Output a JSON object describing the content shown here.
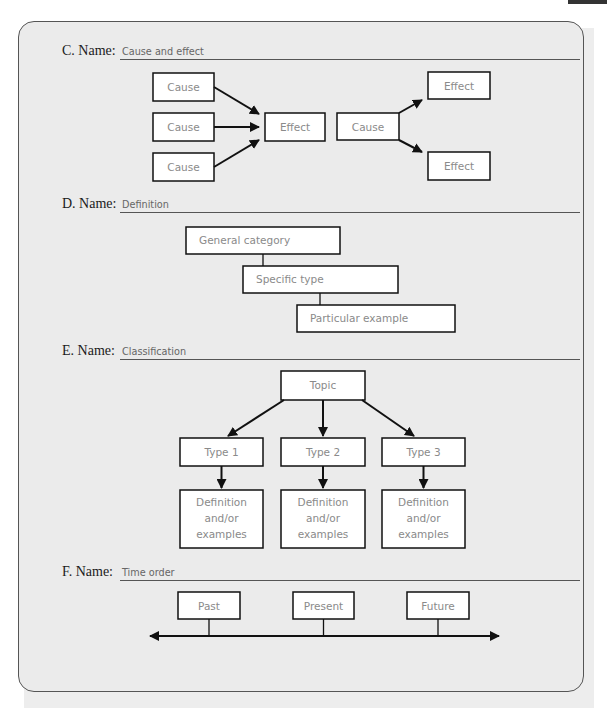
{
  "sections": {
    "c": {
      "label": "C. Name:",
      "value": "Cause and effect",
      "left_causes": [
        "Cause",
        "Cause",
        "Cause"
      ],
      "center_effect": "Effect",
      "right_cause": "Cause",
      "right_effects": [
        "Effect",
        "Effect"
      ]
    },
    "d": {
      "label": "D. Name:",
      "value": "Definition",
      "levels": [
        "General category",
        "Specific type",
        "Particular example"
      ]
    },
    "e": {
      "label": "E. Name:",
      "value": "Classification",
      "topic": "Topic",
      "types": [
        "Type 1",
        "Type 2",
        "Type 3"
      ],
      "details": [
        [
          "Definition",
          "and/or",
          "examples"
        ],
        [
          "Definition",
          "and/or",
          "examples"
        ],
        [
          "Definition",
          "and/or",
          "examples"
        ]
      ]
    },
    "f": {
      "label": "F. Name:",
      "value": "Time order",
      "points": [
        "Past",
        "Present",
        "Future"
      ]
    }
  }
}
